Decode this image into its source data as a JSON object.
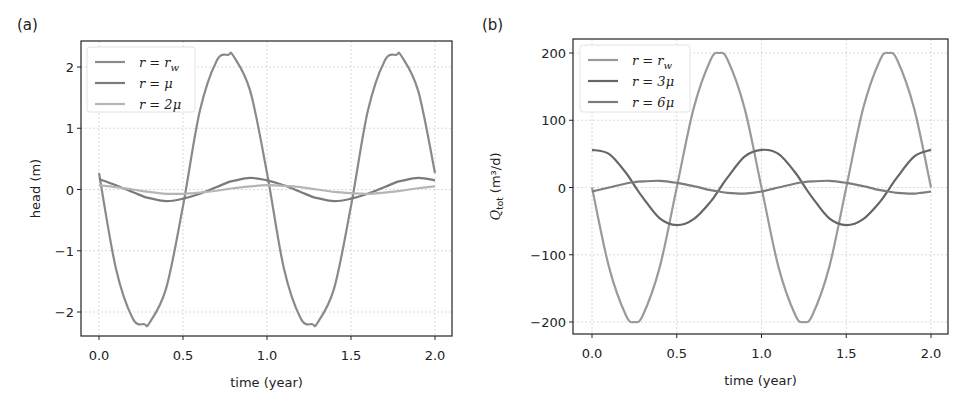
{
  "chart_data": [
    {
      "type": "line",
      "panel_label": "(a)",
      "title": "",
      "xlabel": "time (year)",
      "ylabel": "head (m)",
      "xlim": [
        -0.1,
        2.1
      ],
      "ylim": [
        -2.4,
        2.4
      ],
      "xticks": [
        0.0,
        0.5,
        1.0,
        1.5,
        2.0
      ],
      "xtick_labels": [
        "0.0",
        "0.5",
        "1.0",
        "1.5",
        "2.0"
      ],
      "yticks": [
        -2,
        -1,
        0,
        1,
        2
      ],
      "ytick_labels": [
        "−2",
        "−1",
        "0",
        "1",
        "2"
      ],
      "grid": true,
      "legend_position": "upper left",
      "x": [
        0.0,
        0.1,
        0.2,
        0.27,
        0.3,
        0.4,
        0.5,
        0.6,
        0.7,
        0.77,
        0.8,
        0.9,
        1.0,
        1.1,
        1.2,
        1.27,
        1.3,
        1.4,
        1.5,
        1.6,
        1.7,
        1.77,
        1.8,
        1.9,
        2.0
      ],
      "series": [
        {
          "name": "r = r_w",
          "legend_label": "r = r",
          "legend_sub": "w",
          "color": "#8a8a8a",
          "values": [
            0.27,
            -1.28,
            -2.1,
            -2.2,
            -2.18,
            -1.61,
            -0.27,
            1.28,
            2.1,
            2.2,
            2.18,
            1.61,
            0.27,
            -1.28,
            -2.1,
            -2.2,
            -2.18,
            -1.61,
            -0.27,
            1.28,
            2.1,
            2.2,
            2.18,
            1.61,
            0.27
          ]
        },
        {
          "name": "r = μ",
          "legend_label": "r = μ",
          "legend_sub": "",
          "color": "#7a7a7a",
          "values": [
            0.17,
            0.07,
            -0.04,
            -0.12,
            -0.14,
            -0.19,
            -0.15,
            -0.07,
            0.04,
            0.12,
            0.14,
            0.19,
            0.15,
            0.07,
            -0.04,
            -0.12,
            -0.14,
            -0.19,
            -0.15,
            -0.07,
            0.04,
            0.12,
            0.14,
            0.19,
            0.15
          ]
        },
        {
          "name": "r = 2μ",
          "legend_label": "r = 2μ",
          "legend_sub": "",
          "color": "#b5b5b5",
          "values": [
            0.07,
            0.04,
            0.0,
            -0.03,
            -0.04,
            -0.07,
            -0.07,
            -0.05,
            -0.02,
            0.01,
            0.02,
            0.05,
            0.07,
            0.06,
            0.04,
            0.01,
            0.0,
            -0.04,
            -0.06,
            -0.07,
            -0.05,
            -0.03,
            -0.02,
            0.02,
            0.05
          ]
        }
      ]
    },
    {
      "type": "line",
      "panel_label": "(b)",
      "title": "",
      "xlabel": "time (year)",
      "ylabel": "Q_tot (m³/d)",
      "ylabel_main": "Q",
      "ylabel_sub": "tot",
      "ylabel_rest": " (m³/d)",
      "xlim": [
        -0.1,
        2.1
      ],
      "ylim": [
        -220,
        230
      ],
      "xticks": [
        0.0,
        0.5,
        1.0,
        1.5,
        2.0
      ],
      "xtick_labels": [
        "0.0",
        "0.5",
        "1.0",
        "1.5",
        "2.0"
      ],
      "yticks": [
        -200,
        -100,
        0,
        100,
        200
      ],
      "ytick_labels": [
        "−200",
        "−100",
        "0",
        "100",
        "200"
      ],
      "grid": true,
      "legend_position": "upper left",
      "x": [
        0.0,
        0.1,
        0.2,
        0.25,
        0.3,
        0.4,
        0.5,
        0.6,
        0.7,
        0.75,
        0.8,
        0.9,
        1.0,
        1.1,
        1.2,
        1.25,
        1.3,
        1.4,
        1.5,
        1.6,
        1.7,
        1.75,
        1.8,
        1.9,
        2.0
      ],
      "series": [
        {
          "name": "r = r_w",
          "legend_label": "r = r",
          "legend_sub": "w",
          "color": "#9a9a9a",
          "values": [
            0,
            -118,
            -190,
            -200,
            -190,
            -118,
            0,
            118,
            190,
            200,
            190,
            118,
            0,
            -118,
            -190,
            -200,
            -190,
            -118,
            0,
            118,
            190,
            200,
            190,
            118,
            0
          ]
        },
        {
          "name": "r = 3μ",
          "legend_label": "r = 3μ",
          "legend_sub": "",
          "color": "#666666",
          "values": [
            56,
            50,
            22,
            3,
            -15,
            -46,
            -56,
            -47,
            -21,
            -3,
            15,
            46,
            56,
            50,
            22,
            3,
            -15,
            -46,
            -56,
            -47,
            -21,
            -3,
            15,
            46,
            56
          ]
        },
        {
          "name": "r = 6μ",
          "legend_label": "r = 6μ",
          "legend_sub": "",
          "color": "#7c7c7c",
          "values": [
            -6,
            0,
            6,
            8,
            9,
            10,
            7,
            2,
            -4,
            -6,
            -8,
            -9,
            -6,
            0,
            6,
            8,
            9,
            10,
            7,
            2,
            -4,
            -6,
            -8,
            -9,
            -6
          ]
        }
      ]
    }
  ],
  "layout": {
    "panels": [
      {
        "label_pos": [
          17,
          30
        ],
        "frame": [
          81,
          41,
          452,
          336
        ],
        "x0px": 99,
        "x2px": 435,
        "ytick_top_px": 67,
        "ytick_bot_px": 312,
        "ylabel_x": 40,
        "legend": [
          87,
          47,
          195,
          112
        ]
      },
      {
        "label_pos": [
          482,
          30
        ],
        "frame": [
          573,
          39,
          948,
          334
        ],
        "x0px": 592,
        "x2px": 931,
        "ytick_top_px": 53,
        "ytick_bot_px": 322,
        "ylabel_x": 500,
        "legend": [
          580,
          45,
          690,
          112
        ]
      }
    ]
  }
}
